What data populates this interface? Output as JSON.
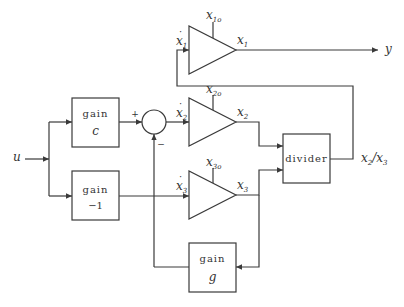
{
  "diagram": {
    "input": {
      "label": "u"
    },
    "output": {
      "label": "y"
    },
    "blocks": {
      "gain_c": {
        "line1": "gain",
        "line2": "c"
      },
      "gain_neg1": {
        "line1": "gain",
        "line2": "−1"
      },
      "gain_g": {
        "line1": "gain",
        "line2": "g"
      },
      "divider": {
        "label": "divider",
        "output_label": "x",
        "output_sub1": "2",
        "output_slash": "/",
        "output_var2": "x",
        "output_sub2": "3"
      }
    },
    "summer": {
      "plus": "+",
      "minus": "−"
    },
    "integrators": [
      {
        "in_var": "x",
        "in_sub": "1",
        "out_var": "x",
        "out_sub": "1",
        "ic_var": "x",
        "ic_sub": "1o"
      },
      {
        "in_var": "x",
        "in_sub": "2",
        "out_var": "x",
        "out_sub": "2",
        "ic_var": "x",
        "ic_sub": "2o"
      },
      {
        "in_var": "x",
        "in_sub": "3",
        "out_var": "x",
        "out_sub": "3",
        "ic_var": "x",
        "ic_sub": "3o"
      }
    ],
    "dot": "·"
  }
}
